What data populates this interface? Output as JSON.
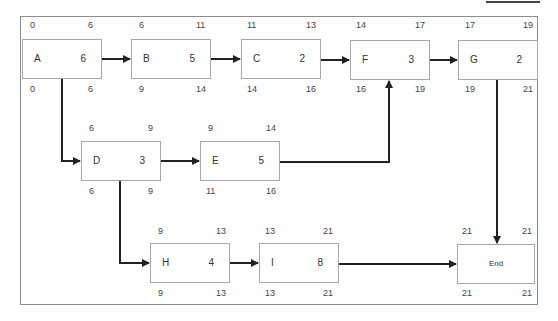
{
  "diagram": {
    "type": "critical-path-network",
    "nodes": [
      {
        "id": "A",
        "name": "A",
        "duration": "6",
        "es": "0",
        "ef": "6",
        "ls": "0",
        "lf": "6"
      },
      {
        "id": "B",
        "name": "B",
        "duration": "5",
        "es": "6",
        "ef": "11",
        "ls": "9",
        "lf": "14"
      },
      {
        "id": "C",
        "name": "C",
        "duration": "2",
        "es": "11",
        "ef": "13",
        "ls": "14",
        "lf": "16"
      },
      {
        "id": "F",
        "name": "F",
        "duration": "3",
        "es": "14",
        "ef": "17",
        "ls": "16",
        "lf": "19"
      },
      {
        "id": "G",
        "name": "G",
        "duration": "2",
        "es": "17",
        "ef": "19",
        "ls": "19",
        "lf": "21"
      },
      {
        "id": "D",
        "name": "D",
        "duration": "3",
        "es": "6",
        "ef": "9",
        "ls": "6",
        "lf": "9"
      },
      {
        "id": "E",
        "name": "E",
        "duration": "5",
        "es": "9",
        "ef": "14",
        "ls": "11",
        "lf": "16"
      },
      {
        "id": "H",
        "name": "H",
        "duration": "4",
        "es": "9",
        "ef": "13",
        "ls": "9",
        "lf": "13"
      },
      {
        "id": "I",
        "name": "I",
        "duration": "8",
        "es": "13",
        "ef": "21",
        "ls": "13",
        "lf": "21"
      },
      {
        "id": "End",
        "name": "End",
        "duration": "",
        "es": "21",
        "ef": "21",
        "ls": "21",
        "lf": "21"
      }
    ],
    "edges": [
      [
        "A",
        "B"
      ],
      [
        "B",
        "C"
      ],
      [
        "C",
        "F"
      ],
      [
        "F",
        "G"
      ],
      [
        "A",
        "D"
      ],
      [
        "D",
        "E"
      ],
      [
        "E",
        "F"
      ],
      [
        "D",
        "H"
      ],
      [
        "H",
        "I"
      ],
      [
        "I",
        "End"
      ],
      [
        "G",
        "End"
      ]
    ]
  }
}
